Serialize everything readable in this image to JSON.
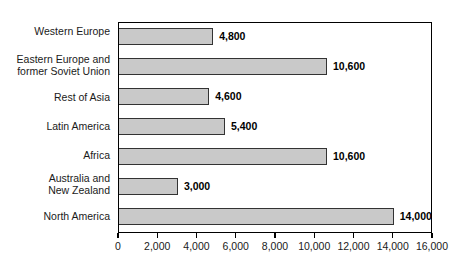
{
  "chart_data": {
    "type": "bar",
    "orientation": "horizontal",
    "title": "",
    "subtitle": "",
    "xlabel": "",
    "ylabel": "",
    "xlim": [
      0,
      16000
    ],
    "grid": false,
    "legend": null,
    "tick_labels": [
      "0",
      "2,000",
      "4,000",
      "6,000",
      "8,000",
      "10,000",
      "12,000",
      "14,000",
      "16,000"
    ],
    "tick_values": [
      0,
      2000,
      4000,
      6000,
      8000,
      10000,
      12000,
      14000,
      16000
    ],
    "categories": [
      "Western Europe",
      "Eastern Europe and\nformer Soviet Union",
      "Rest of Asia",
      "Latin America",
      "Africa",
      "Australia and\nNew Zealand",
      "North America"
    ],
    "values": [
      4800,
      10600,
      4600,
      5400,
      10600,
      3000,
      14000
    ],
    "value_labels": [
      "4,800",
      "10,600",
      "4,600",
      "5,400",
      "10,600",
      "3,000",
      "14,000"
    ],
    "bar_color": "#c9c9c9",
    "bar_border_color": "#333333",
    "axis_color": "#000000",
    "background": "#ffffff"
  }
}
